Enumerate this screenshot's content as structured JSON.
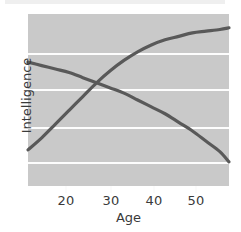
{
  "figure": {
    "width": 241,
    "height": 232,
    "background_color": "#ffffff",
    "panel_color": "#c9c9c9",
    "gridline_color": "#fdfdfd",
    "curve_color": "#595959",
    "text_color": "#3a3a3a",
    "top_band_color": "#efefef"
  },
  "chart_data": {
    "type": "line",
    "title": "",
    "subtitle": "",
    "xlabel": "Age",
    "ylabel": "Intelligence",
    "xlim": [
      14,
      58
    ],
    "ylim": [
      0,
      100
    ],
    "xticks": [
      20,
      30,
      40,
      50
    ],
    "xticklabels": [
      "20",
      "30",
      "40",
      "50"
    ],
    "yticks": [],
    "yticklabels": [],
    "grid": "horizontal",
    "gridline_count": 4,
    "legend": "none",
    "annotations": [],
    "series": [
      {
        "name": "rising-curve",
        "description": "increasing, concave-down curve rising steeply from low values in the teens and flattening after about age 40",
        "x": [
          14,
          17,
          20,
          23,
          26,
          29,
          32,
          35,
          38,
          41,
          44,
          47,
          50,
          53,
          56,
          58
        ],
        "y": [
          21,
          28,
          36,
          44,
          52,
          60,
          67,
          73,
          78,
          82,
          85,
          87,
          89,
          90,
          91,
          92
        ]
      },
      {
        "name": "declining-curve",
        "description": "decreasing, concave-down curve starting high in the teens and falling at an accelerating rate",
        "x": [
          14,
          17,
          20,
          23,
          26,
          29,
          32,
          35,
          38,
          41,
          44,
          47,
          50,
          53,
          56,
          58
        ],
        "y": [
          72,
          70,
          68,
          66,
          63,
          60,
          57,
          54,
          50,
          46,
          42,
          37,
          32,
          26,
          20,
          14
        ]
      }
    ],
    "crossing_point": {
      "x": 27,
      "y": 54
    }
  },
  "axes": {
    "x_title": "Age",
    "y_title": "Intelligence",
    "x_tick_labels": [
      "20",
      "30",
      "40",
      "50"
    ]
  }
}
